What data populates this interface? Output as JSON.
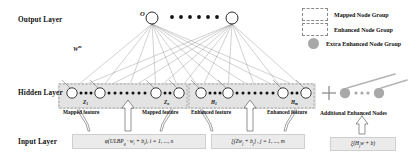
{
  "layers": {
    "output_label": "Output Layer",
    "hidden_label": "Hidden Layer",
    "input_label": "Input Layer"
  },
  "output": {
    "node_symbol": "O",
    "weight_label": "W",
    "weight_superscript": "m"
  },
  "hidden": {
    "groups": [
      {
        "tag": "Z",
        "sub": "1",
        "caption": "Mapped feature",
        "kind": "mapped"
      },
      {
        "tag": "Z",
        "sub": "n",
        "caption": "Mapped feature",
        "kind": "mapped"
      },
      {
        "tag": "H",
        "sub": "1",
        "caption": "Enhanced feature",
        "kind": "enhanced"
      },
      {
        "tag": "H",
        "sub": "m",
        "caption": "Enhanced feature",
        "kind": "enhanced"
      }
    ],
    "plus_sign": "+",
    "additional_label": "Additional Enhanced Nodes"
  },
  "formulas": [
    {
      "text": "φ(ULBP",
      "sub": "g",
      "rest": " · w",
      "sub2": "i",
      "rest2": " + b",
      "sub3": "i",
      "rest3": "), i = 1, ..., n",
      "full": "φ(ULBPg · wi + bi), i = 1, ..., n"
    },
    {
      "text": "ξ(Zw",
      "sub": "j",
      "rest": " + b",
      "sub2": "j",
      "rest2": "), j = 1, ..., m",
      "full": "ξ(Zwj + bj), j = 1, ..., m"
    },
    {
      "text": "ξ(H",
      "sub": "j",
      "rest": "w + b)",
      "full": "ξ(Hjw + b)"
    }
  ],
  "legend": {
    "items": [
      {
        "label": "Mapped Node Group",
        "style": "dashed-box"
      },
      {
        "label": "Enhanced Node Group",
        "style": "dashed-box"
      },
      {
        "label": "Extra Enhanced Node Group",
        "style": "gray-circle"
      }
    ]
  },
  "colors": {
    "node_stroke": "#111111",
    "extra_node_fill": "#a8a8a8",
    "band_fill": "#e3e3e3",
    "formula_box_fill": "#ebebeb",
    "arrow_stroke": "#555555"
  }
}
